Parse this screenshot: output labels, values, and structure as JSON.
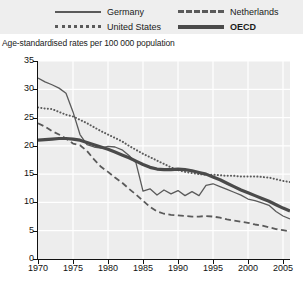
{
  "legend": {
    "items": [
      {
        "label": "Germany",
        "style": "solid-thin",
        "color": "#5a5a5a",
        "bold": false
      },
      {
        "label": "United States",
        "style": "dotted",
        "color": "#5a5a5a",
        "bold": false
      },
      {
        "label": "Netherlands",
        "style": "dashed",
        "color": "#5a5a5a",
        "bold": false
      },
      {
        "label": "OECD",
        "style": "solid-thick",
        "color": "#4a4a4a",
        "bold": true
      }
    ]
  },
  "subtitle": "Age-standardised rates per 100 000 population",
  "chart_data": {
    "type": "line",
    "title": "",
    "subtitle": "Age-standardised rates per 100 000 population",
    "xlabel": "",
    "ylabel": "",
    "xlim": [
      1970,
      2006
    ],
    "ylim": [
      0,
      35
    ],
    "ytick_labels": [
      "0",
      "5",
      "10",
      "15",
      "20",
      "25",
      "30",
      "35"
    ],
    "ytick_values": [
      0,
      5,
      10,
      15,
      20,
      25,
      30,
      35
    ],
    "xtick_labels": [
      "1970",
      "1975",
      "1980",
      "1985",
      "1990",
      "1995",
      "2000",
      "2005"
    ],
    "xtick_values": [
      1970,
      1975,
      1980,
      1985,
      1990,
      1995,
      2000,
      2005
    ],
    "grid": true,
    "legend_position": "top",
    "x": [
      1970,
      1971,
      1972,
      1973,
      1974,
      1975,
      1976,
      1977,
      1978,
      1979,
      1980,
      1981,
      1982,
      1983,
      1984,
      1985,
      1986,
      1987,
      1988,
      1989,
      1990,
      1991,
      1992,
      1993,
      1994,
      1995,
      1996,
      1997,
      1998,
      1999,
      2000,
      2001,
      2002,
      2003,
      2004,
      2005,
      2006
    ],
    "series": [
      {
        "name": "Germany",
        "style": "solid-thin",
        "color": "#5a5a5a",
        "values": [
          32.0,
          31.3,
          30.8,
          30.2,
          29.3,
          26.0,
          22.0,
          20.2,
          19.8,
          19.6,
          19.9,
          19.8,
          19.3,
          18.3,
          17.0,
          12.0,
          12.4,
          11.3,
          12.2,
          11.5,
          12.1,
          11.2,
          11.9,
          11.2,
          13.0,
          13.3,
          12.8,
          12.3,
          11.8,
          11.3,
          10.6,
          10.3,
          9.9,
          9.5,
          8.4,
          7.6,
          7.1
        ]
      },
      {
        "name": "United States",
        "style": "dotted",
        "color": "#5a5a5a",
        "values": [
          26.8,
          26.6,
          26.5,
          26.0,
          25.5,
          25.2,
          24.6,
          24.0,
          23.3,
          22.6,
          22.0,
          21.4,
          20.8,
          20.0,
          19.3,
          18.6,
          18.0,
          17.4,
          16.8,
          16.2,
          15.7,
          15.4,
          15.2,
          15.0,
          14.9,
          14.9,
          14.8,
          14.7,
          14.7,
          14.6,
          14.6,
          14.6,
          14.5,
          14.4,
          14.1,
          13.8,
          13.6
        ]
      },
      {
        "name": "Netherlands",
        "style": "dashed",
        "color": "#5a5a5a",
        "values": [
          24.0,
          23.4,
          22.6,
          22.0,
          21.3,
          20.4,
          20.1,
          19.1,
          17.6,
          16.3,
          15.4,
          14.4,
          13.5,
          12.4,
          11.4,
          10.3,
          9.2,
          8.4,
          8.0,
          7.8,
          7.7,
          7.6,
          7.5,
          7.5,
          7.6,
          7.5,
          7.3,
          7.0,
          6.8,
          6.6,
          6.4,
          6.1,
          5.9,
          5.6,
          5.3,
          5.1,
          4.9
        ]
      },
      {
        "name": "OECD",
        "style": "solid-thick",
        "color": "#4a4a4a",
        "values": [
          21.0,
          21.1,
          21.2,
          21.3,
          21.3,
          21.2,
          21.0,
          20.6,
          20.2,
          19.8,
          19.4,
          18.9,
          18.4,
          17.9,
          17.3,
          16.7,
          16.2,
          15.9,
          15.8,
          15.8,
          15.9,
          15.8,
          15.6,
          15.3,
          15.0,
          14.5,
          14.0,
          13.4,
          12.8,
          12.2,
          11.7,
          11.2,
          10.7,
          10.2,
          9.6,
          9.0,
          8.5
        ]
      }
    ]
  }
}
